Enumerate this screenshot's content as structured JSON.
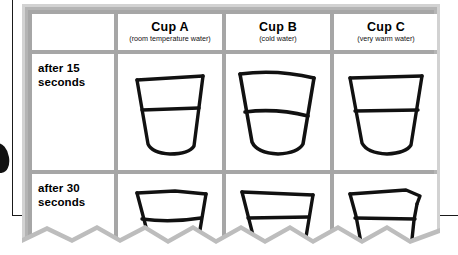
{
  "worksheet": {
    "table": {
      "corner_label": "",
      "columns": [
        {
          "title": "Cup A",
          "subtitle": "(room temperature water)"
        },
        {
          "title": "Cup B",
          "subtitle": "(cold water)"
        },
        {
          "title": "Cup C",
          "subtitle": "(very warm water)"
        }
      ],
      "rows": [
        {
          "label_line1": "after 15",
          "label_line2": "seconds"
        },
        {
          "label_line1": "after 30",
          "label_line2": "seconds"
        }
      ]
    },
    "drawings": {
      "row1_cup_a": "hand-drawn-cup-with-water-line",
      "row1_cup_b": "hand-drawn-cup-with-water-line",
      "row1_cup_c": "hand-drawn-cup-with-water-line",
      "row2_cup_a": "hand-drawn-cup-clipped-by-torn-edge",
      "row2_cup_b": "hand-drawn-cup-clipped-by-torn-edge",
      "row2_cup_c": "hand-drawn-cup-clipped-by-torn-edge"
    },
    "page_marks": {
      "left_rule": "page-edge-rule",
      "tab_blob": "black-page-tab-marker",
      "right_rule": "page-edge-rule",
      "bottom": "torn-paper-edge"
    },
    "colors": {
      "grid": "#a6a6a6",
      "frame_outer": "#d2d2d2",
      "cell": "#ffffff",
      "ink": "#111111",
      "rule": "#1a1a1a"
    }
  }
}
